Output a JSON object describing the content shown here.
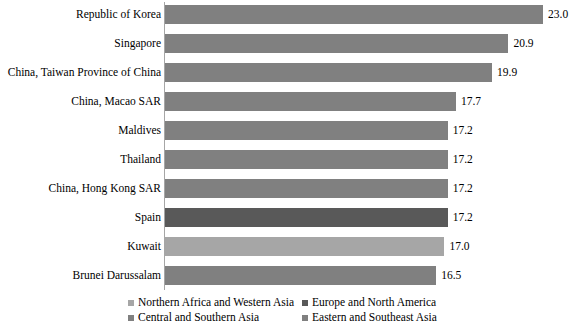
{
  "chart_data": {
    "type": "bar",
    "orientation": "horizontal",
    "title": "",
    "xlabel": "",
    "ylabel": "",
    "xlim": [
      0,
      25
    ],
    "grid": false,
    "categories": [
      "Republic of Korea",
      "Singapore",
      "China, Taiwan Province of China",
      "China, Macao SAR",
      "Maldives",
      "Thailand",
      "China, Hong Kong SAR",
      "Spain",
      "Kuwait",
      "Brunei Darussalam"
    ],
    "values": [
      23.0,
      20.9,
      19.9,
      17.7,
      17.2,
      17.2,
      17.2,
      17.2,
      17.0,
      16.5
    ],
    "value_labels": [
      "23.0",
      "20.9",
      "19.9",
      "17.7",
      "17.2",
      "17.2",
      "17.2",
      "17.2",
      "17.0",
      "16.5"
    ],
    "bar_groups": [
      "Eastern and Southeast Asia",
      "Eastern and Southeast Asia",
      "Eastern and Southeast Asia",
      "Eastern and Southeast Asia",
      "Eastern and Southeast Asia",
      "Eastern and Southeast Asia",
      "Eastern and Southeast Asia",
      "Europe and North America",
      "Northern Africa and Western Asia",
      "Eastern and Southeast Asia"
    ],
    "bar_colors": [
      "#808080",
      "#808080",
      "#808080",
      "#808080",
      "#808080",
      "#808080",
      "#808080",
      "#595959",
      "#a6a6a6",
      "#808080"
    ],
    "legend": {
      "position": "bottom",
      "entries": [
        {
          "label": "Northern Africa and Western Asia",
          "color": "#a6a6a6"
        },
        {
          "label": "Europe and North America",
          "color": "#595959"
        },
        {
          "label": "Central and Southern Asia",
          "color": "#808080"
        },
        {
          "label": "Eastern and Southeast Asia",
          "color": "#808080"
        }
      ]
    }
  }
}
